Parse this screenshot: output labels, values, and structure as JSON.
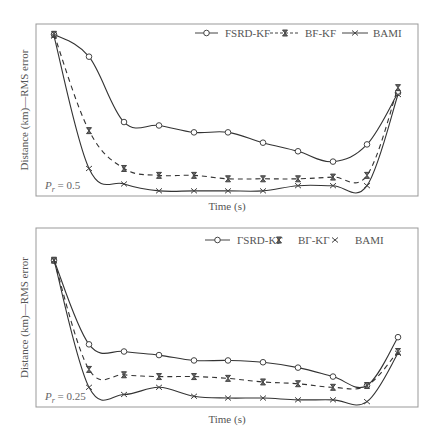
{
  "chart_data": [
    {
      "type": "line",
      "title": "",
      "annotation": "P_r = 0.5",
      "annotation_main": "P",
      "annotation_sub": "r",
      "annotation_value": " = 0.5",
      "xlabel": "Time (s)",
      "ylabel": "Distance (km)—RMS error",
      "x": [
        1,
        2,
        3,
        4,
        5,
        6,
        7,
        8,
        9,
        10,
        11
      ],
      "ylim": [
        0,
        100
      ],
      "grid": false,
      "legend_position": "top-right",
      "series": [
        {
          "name": "FSRD-KF",
          "style": "solid",
          "marker": "circle",
          "values": [
            94,
            81,
            43,
            41,
            37,
            37,
            31,
            26,
            20,
            30,
            60
          ]
        },
        {
          "name": "BF-KF",
          "style": "dashed",
          "marker": "hourglass",
          "values": [
            94,
            38,
            16,
            12,
            12,
            10,
            10,
            10,
            11,
            12,
            63
          ]
        },
        {
          "name": "BAMI",
          "style": "solid",
          "marker": "x",
          "values": [
            93,
            16,
            7,
            3,
            3,
            3,
            3,
            6,
            6,
            6,
            59
          ]
        }
      ]
    },
    {
      "type": "line",
      "title": "",
      "annotation": "P_r = 0.25",
      "annotation_main": "P",
      "annotation_sub": "r",
      "annotation_value": " = 0.25",
      "xlabel": "Time (s)",
      "ylabel": "Distance (km)—RMS error",
      "x": [
        1,
        2,
        3,
        4,
        5,
        6,
        7,
        8,
        9,
        10,
        11
      ],
      "ylim": [
        0,
        100
      ],
      "grid": false,
      "legend_position": "top-right",
      "series": [
        {
          "name": "ΓSRD-KΓ",
          "style": "solid",
          "marker": "circle",
          "values": [
            82,
            35,
            31,
            29,
            26,
            26,
            25,
            22,
            17,
            12,
            39
          ]
        },
        {
          "name": "BΓ-KΓ",
          "style": "dashed",
          "marker": "hourglass",
          "values": [
            82,
            21,
            18,
            17,
            17,
            16,
            14,
            13,
            11,
            12,
            31
          ]
        },
        {
          "name": "BAMI",
          "style": "solid",
          "marker": "x",
          "values": [
            82,
            11,
            7,
            11,
            6,
            5,
            5,
            4,
            4,
            3,
            30
          ]
        }
      ]
    }
  ]
}
